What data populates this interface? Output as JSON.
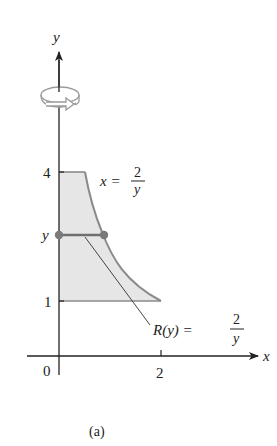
{
  "figure": {
    "caption": "(a)",
    "axes": {
      "x_label": "x",
      "y_label": "y",
      "origin_label": "0",
      "x_ticks": [
        {
          "value": 2,
          "label": "2"
        }
      ],
      "y_ticks": [
        {
          "value": 1,
          "label": "1"
        },
        {
          "value": 4,
          "label": "4"
        }
      ],
      "y_level_label": "y"
    },
    "curve": {
      "equation_lhs": "x =",
      "numerator": "2",
      "denominator": "y"
    },
    "radius": {
      "equation_lhs": "R(y) =",
      "numerator": "2",
      "denominator": "y"
    },
    "region": {
      "description": "Region bounded by x = 2/y, x = 0, y = 1, y = 4",
      "fill_color": "#e6e6e6",
      "edge_color": "#8a8a8a"
    },
    "rotation_icon": "rotation-arrow-icon",
    "colors": {
      "axis": "#222222",
      "dot": "#7a7a7a",
      "segment": "#6f6f6f"
    }
  }
}
